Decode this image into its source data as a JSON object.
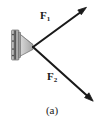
{
  "figure": {
    "caption": "(a)",
    "background_color": "#ffffff",
    "ink_color": "#1a1a1a",
    "labels": {
      "force_1": {
        "symbol": "F",
        "subscript": "1"
      },
      "force_2": {
        "symbol": "F",
        "subscript": "2"
      }
    },
    "support": {
      "name": "wall-mounted bracket",
      "plate_color": "#b0b0b0",
      "plate_edge_color": "#555555",
      "cone_color": "#c8c8c8",
      "cone_edge_color": "#6a6a6a",
      "bolt_color": "#3a3a3a"
    },
    "vectors": [
      {
        "name": "F1",
        "origin": {
          "x": 33,
          "y": 47
        },
        "tip": {
          "x": 86,
          "y": 8
        },
        "direction": "up-right",
        "color": "#1a1a1a"
      },
      {
        "name": "F2",
        "origin": {
          "x": 33,
          "y": 47
        },
        "tip": {
          "x": 93,
          "y": 101
        },
        "direction": "down-right",
        "color": "#1a1a1a"
      }
    ]
  }
}
